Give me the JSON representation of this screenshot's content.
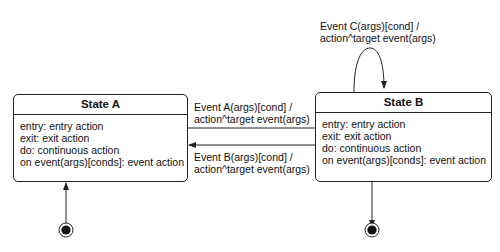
{
  "states": [
    {
      "title": "State A",
      "lines": [
        "entry: entry action",
        "exit: exit action",
        "do: continuous action",
        "on event(args)[conds]: event action"
      ]
    },
    {
      "title": "State B",
      "lines": [
        "entry: entry action",
        "exit: exit action",
        "do: continuous action",
        "on event(args)[conds]: event action"
      ]
    }
  ],
  "transitions": [
    {
      "from": "State A",
      "to": "State B",
      "line1": "Event A(args)[cond] /",
      "line2": "action^target event(args)"
    },
    {
      "from": "State B",
      "to": "State A",
      "line1": "Event B(args)[cond] /",
      "line2": "action^target event(args)"
    },
    {
      "from": "State B",
      "to": "State B",
      "line1": "Event C(args)[cond] /",
      "line2": "action^target event(args)"
    }
  ],
  "pseudostates": [
    {
      "kind": "initial",
      "target": "State A"
    },
    {
      "kind": "final",
      "source": "State B"
    }
  ]
}
